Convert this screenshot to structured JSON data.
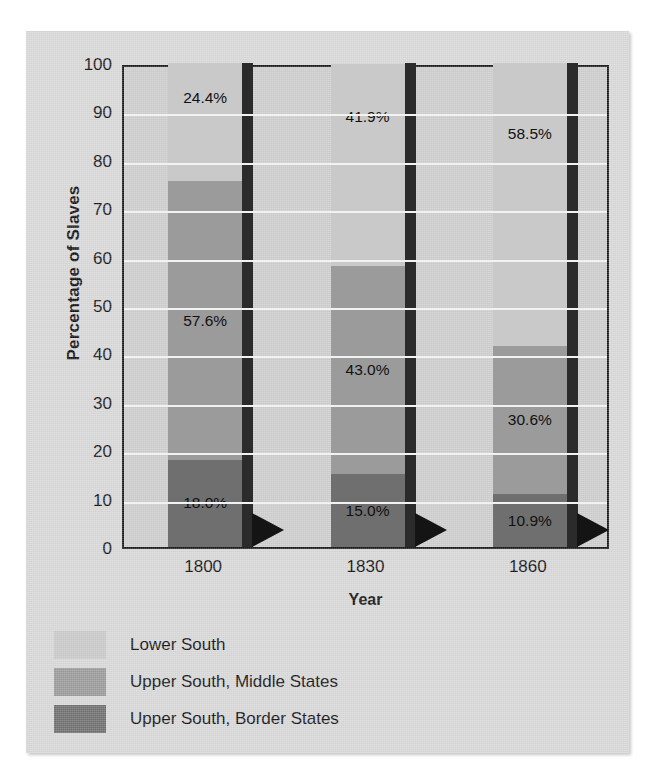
{
  "chart_data": {
    "type": "bar",
    "subtype": "stacked-bar-100",
    "title": "",
    "xlabel": "Year",
    "ylabel": "Percentage of Slaves",
    "categories": [
      "1800",
      "1830",
      "1860"
    ],
    "ylim": [
      0,
      100
    ],
    "yticks": [
      0,
      10,
      20,
      30,
      40,
      50,
      60,
      70,
      80,
      90,
      100
    ],
    "ytick_labels": [
      "0",
      "10",
      "20",
      "30",
      "40",
      "50",
      "60",
      "70",
      "80",
      "90",
      "100"
    ],
    "grid": true,
    "legend_position": "below",
    "series": [
      {
        "name": "Lower South",
        "color": "#c9c9c9",
        "values": [
          24.4,
          41.9,
          58.5
        ],
        "labels": [
          "24.4%",
          "41.9%",
          "58.5%"
        ]
      },
      {
        "name": "Upper South, Middle States",
        "color": "#9b9b9b",
        "values": [
          57.6,
          43.0,
          30.6
        ],
        "labels": [
          "57.6%",
          "43.0%",
          "30.6%"
        ]
      },
      {
        "name": "Upper South, Border States",
        "color": "#6f6f6f",
        "values": [
          18.0,
          15.0,
          10.9
        ],
        "labels": [
          "18.0%",
          "15.0%",
          "10.9%"
        ]
      }
    ]
  },
  "axes": {
    "y_title": "Percentage of Slaves",
    "x_title": "Year",
    "y_tick_labels": [
      "100",
      "90",
      "80",
      "70",
      "60",
      "50",
      "40",
      "30",
      "20",
      "10",
      "0"
    ],
    "x_tick_labels": [
      "1800",
      "1830",
      "1860"
    ]
  },
  "legend": {
    "items": [
      {
        "label": "Lower South",
        "color": "#c9c9c9"
      },
      {
        "label": "Upper South, Middle States",
        "color": "#9b9b9b"
      },
      {
        "label": "Upper South, Border States",
        "color": "#6f6f6f"
      }
    ]
  },
  "bar_labels": {
    "b0s0": "24.4%",
    "b0s1": "57.6%",
    "b0s2": "18.0%",
    "b1s0": "41.9%",
    "b1s1": "43.0%",
    "b1s2": "15.0%",
    "b2s0": "58.5%",
    "b2s1": "30.6%",
    "b2s2": "10.9%"
  },
  "colors": {
    "page_background": "#ffffff",
    "figure_background": "#d8d8d8",
    "plot_background": "#cdcdcd",
    "axis_line": "#1a1a1a",
    "gridline": "#f2f2f2",
    "text": "#111111",
    "shadow": "#2b2b2b"
  }
}
